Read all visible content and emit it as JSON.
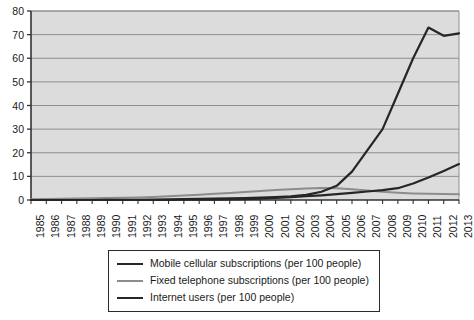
{
  "chart_data": {
    "type": "line",
    "title": "",
    "subtitle": "",
    "xlabel": "",
    "ylabel": "",
    "xlim": [
      1985,
      2013
    ],
    "ylim": [
      0,
      80
    ],
    "yticks": [
      0,
      10,
      20,
      30,
      40,
      50,
      60,
      70,
      80
    ],
    "grid": "horizontal",
    "legend_position": "below-axis",
    "plot_background": "#dcdcdc",
    "figure_background": "#ffffff",
    "categories": [
      "1985",
      "1986",
      "1987",
      "1988",
      "1989",
      "1990",
      "1991",
      "1992",
      "1993",
      "1994",
      "1995",
      "1996",
      "1997",
      "1998",
      "1999",
      "2000",
      "2001",
      "2002",
      "2003",
      "2004",
      "2005",
      "2006",
      "2007",
      "2008",
      "2009",
      "2010",
      "2011",
      "2012",
      "2013"
    ],
    "series": [
      {
        "name": "Mobile cellular subscriptions (per 100 people)",
        "color": "#262626",
        "width": 2.2,
        "values": [
          0.0,
          0.0,
          0.0,
          0.0,
          0.0,
          0.1,
          0.1,
          0.1,
          0.2,
          0.3,
          0.4,
          0.5,
          0.6,
          0.7,
          0.8,
          1.0,
          1.2,
          1.5,
          2.2,
          3.5,
          6.0,
          12.0,
          21.0,
          30.0,
          45.0,
          60.0,
          73.0,
          69.5,
          70.5
        ]
      },
      {
        "name": "Fixed telephone subscriptions (per 100 people)",
        "color": "#8c8c8c",
        "width": 2.0,
        "values": [
          0.3,
          0.4,
          0.5,
          0.6,
          0.7,
          0.8,
          0.9,
          1.1,
          1.3,
          1.6,
          1.9,
          2.2,
          2.6,
          3.0,
          3.4,
          3.8,
          4.2,
          4.6,
          4.9,
          5.1,
          5.0,
          4.6,
          4.0,
          3.5,
          3.1,
          2.8,
          2.6,
          2.5,
          2.4
        ]
      },
      {
        "name": "Internet users (per 100 people)",
        "color": "#262626",
        "width": 2.2,
        "values": [
          0.0,
          0.0,
          0.0,
          0.0,
          0.0,
          0.0,
          0.0,
          0.0,
          0.0,
          0.0,
          0.1,
          0.1,
          0.2,
          0.3,
          0.4,
          0.6,
          0.9,
          1.2,
          1.6,
          2.0,
          2.5,
          3.0,
          3.6,
          4.2,
          5.0,
          7.0,
          9.5,
          12.3,
          15.2
        ]
      }
    ]
  },
  "legend": {
    "entries": [
      {
        "label": "Mobile cellular subscriptions (per 100 people)"
      },
      {
        "label": "Fixed telephone subscriptions (per 100 people)"
      },
      {
        "label": "Internet users (per 100 people)"
      }
    ]
  }
}
